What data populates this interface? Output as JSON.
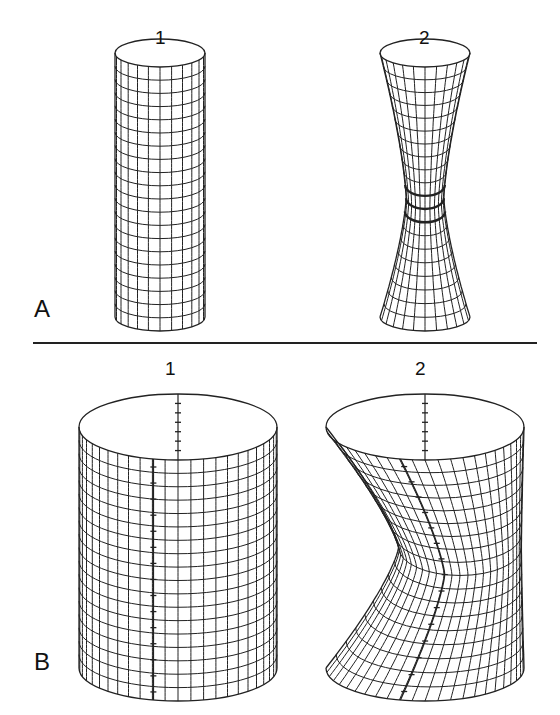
{
  "figure": {
    "stroke_color": "#222222",
    "background": "#ffffff",
    "divider": {
      "x1": 33,
      "x2": 537,
      "y": 343
    }
  },
  "panels": [
    {
      "id": "A",
      "label": "A",
      "cylinders": [
        {
          "number": "1",
          "type": "straight",
          "cx": 160,
          "top": 53,
          "bottom": 317,
          "rx": 45,
          "ry": 14,
          "rings": 20,
          "meridians": 12,
          "axis_ticks": false
        },
        {
          "number": "2",
          "type": "hourglass",
          "cx": 425,
          "top": 53,
          "bottom": 317,
          "rx": 45,
          "ry": 14,
          "waist_ratio": 0.42,
          "waist_pos": 0.55,
          "rings": 20,
          "meridians": 12,
          "axis_ticks": false
        }
      ]
    },
    {
      "id": "B",
      "label": "B",
      "cylinders": [
        {
          "number": "1",
          "type": "straight",
          "cx": 178,
          "top": 427,
          "bottom": 668,
          "rx": 99,
          "ry": 33,
          "rings": 18,
          "meridians": 24,
          "axis_ticks": true
        },
        {
          "number": "2",
          "type": "sheared",
          "cx": 425,
          "top": 427,
          "bottom": 668,
          "rx": 99,
          "ry": 33,
          "waist_pos": 0.5,
          "shear": 35,
          "rings": 18,
          "meridians": 24,
          "axis_ticks": true
        }
      ]
    }
  ],
  "labels": {
    "A_num1": "1",
    "A_num2": "2",
    "A_panel": "A",
    "B_num1": "1",
    "B_num2": "2",
    "B_panel": "B"
  }
}
